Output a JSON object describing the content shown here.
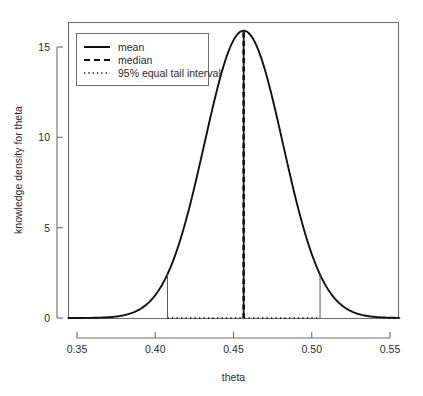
{
  "chart_data": {
    "type": "line",
    "title": "",
    "xlabel": "theta",
    "ylabel": "knowledge density for theta",
    "xlim": [
      0.34,
      0.5612
    ],
    "ylim": [
      -0.35,
      16.4
    ],
    "grid": false,
    "legend_position": "top-left",
    "distribution": {
      "family": "normal",
      "mean": 0.4565,
      "sd": 0.0251,
      "peak_density": 15.9,
      "peak_x": 0.4565
    },
    "xticks": [
      0.35,
      0.4,
      0.45,
      0.5,
      0.55
    ],
    "xtick_labels": [
      "0.35",
      "0.40",
      "0.45",
      "0.50",
      "0.55"
    ],
    "yticks": [
      0,
      5,
      10,
      15
    ],
    "ytick_labels": [
      "0",
      "5",
      "10",
      "15"
    ],
    "annotations": {
      "mean_value": 0.4565,
      "median_value": 0.4565,
      "interval_lower": 0.4078,
      "interval_upper": 0.5053,
      "interval_level": "95%",
      "interval_y": 0
    },
    "series": [
      {
        "name": "density",
        "x": [
          0.34,
          0.345,
          0.35,
          0.355,
          0.36,
          0.365,
          0.37,
          0.375,
          0.38,
          0.385,
          0.39,
          0.395,
          0.4,
          0.405,
          0.41,
          0.415,
          0.42,
          0.425,
          0.43,
          0.435,
          0.44,
          0.445,
          0.45,
          0.455,
          0.4565,
          0.46,
          0.465,
          0.47,
          0.475,
          0.48,
          0.485,
          0.49,
          0.495,
          0.5,
          0.505,
          0.51,
          0.515,
          0.52,
          0.525,
          0.53,
          0.535,
          0.54,
          0.545,
          0.55,
          0.555,
          0.56
        ],
        "y": [
          0.0,
          0.0,
          0.01,
          0.02,
          0.05,
          0.12,
          0.27,
          0.57,
          1.12,
          2.04,
          3.45,
          5.43,
          7.94,
          10.71,
          13.28,
          15.07,
          15.87,
          15.87,
          15.89,
          15.89,
          15.89,
          15.89,
          15.89,
          15.89,
          15.9,
          15.89,
          15.89,
          15.89,
          15.88,
          15.06,
          13.27,
          10.7,
          7.93,
          5.42,
          3.44,
          2.03,
          1.11,
          0.56,
          0.26,
          0.11,
          0.04,
          0.02,
          0.01,
          0.0,
          0.0,
          0.0
        ]
      }
    ],
    "legend": [
      {
        "label": "mean",
        "style": "solid"
      },
      {
        "label": "median",
        "style": "dashed"
      },
      {
        "label": "95% equal tail interval",
        "style": "dotted"
      }
    ]
  },
  "axes": {
    "x": {
      "title": "theta",
      "tick_labels": [
        "0.35",
        "0.40",
        "0.45",
        "0.50",
        "0.55"
      ]
    },
    "y": {
      "title": "knowledge density for theta",
      "tick_labels": [
        "0",
        "5",
        "10",
        "15"
      ]
    }
  },
  "legend": {
    "items": [
      {
        "label": "mean"
      },
      {
        "label": "median"
      },
      {
        "label": "95% equal tail interval"
      }
    ]
  },
  "colors": {
    "background": "#ffffff",
    "curve": "#111111",
    "axis": "#6e6e6e",
    "text": "#2b2b2b"
  }
}
